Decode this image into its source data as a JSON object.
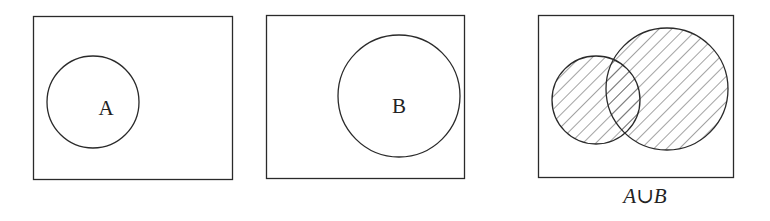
{
  "diagrams": [
    {
      "id": "set-a",
      "label": "A",
      "caption": ""
    },
    {
      "id": "set-b",
      "label": "B",
      "caption": ""
    },
    {
      "id": "union",
      "label": "",
      "caption": "A∪B"
    }
  ],
  "colors": {
    "stroke": "#2a2a2a",
    "hatch": "#555555",
    "background": "#ffffff"
  }
}
